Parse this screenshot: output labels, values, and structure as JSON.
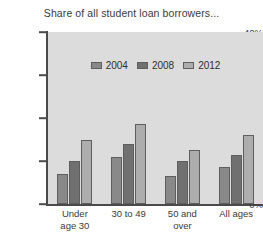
{
  "chart_data": {
    "type": "bar",
    "title": "Share of all student loan borrowers...",
    "xlabel": "",
    "ylabel": "",
    "ylim": [
      0,
      40
    ],
    "ytick_labels": [
      "0%",
      "10%",
      "20%",
      "30%",
      "40%"
    ],
    "ytick_values": [
      0,
      10,
      20,
      30,
      40
    ],
    "grid": false,
    "legend_position": "top-center",
    "categories": [
      "Under age 30",
      "30 to 49",
      "50 and over",
      "All ages"
    ],
    "category_lines": [
      [
        "Under",
        "age 30"
      ],
      [
        "30 to 49",
        ""
      ],
      [
        "50 and",
        "over"
      ],
      [
        "All ages",
        ""
      ]
    ],
    "series": [
      {
        "name": "2004",
        "color": "#898989",
        "values": [
          7,
          11,
          6.5,
          8.5
        ]
      },
      {
        "name": "2008",
        "color": "#707070",
        "values": [
          10,
          14,
          10,
          11.5
        ]
      },
      {
        "name": "2012",
        "color": "#adadad",
        "values": [
          15,
          18.5,
          12.5,
          16
        ]
      }
    ]
  },
  "colors": {
    "plot_background": "#dcdcdc",
    "axis": "#4a4a4a",
    "text": "#3a3a3a",
    "bar_outline": "#5e5e5e"
  }
}
